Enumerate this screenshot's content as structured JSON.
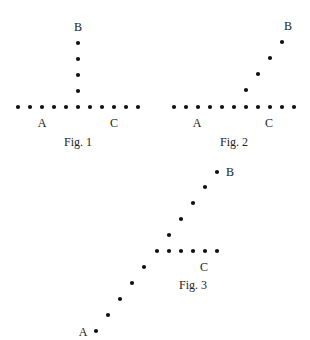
{
  "dot_color": "#111111",
  "dot_radius": 2.1,
  "figures": [
    {
      "id": "fig1",
      "caption": "Fig. 1",
      "caption_pos": [
        78,
        146
      ],
      "labels": [
        {
          "text": "B",
          "x": 78,
          "y": 31
        },
        {
          "text": "A",
          "x": 42,
          "y": 127
        },
        {
          "text": "C",
          "x": 114,
          "y": 127
        }
      ],
      "dots": [
        [
          18,
          107
        ],
        [
          30,
          107
        ],
        [
          42,
          107
        ],
        [
          54,
          107
        ],
        [
          66,
          107
        ],
        [
          78,
          107
        ],
        [
          90,
          107
        ],
        [
          102,
          107
        ],
        [
          114,
          107
        ],
        [
          126,
          107
        ],
        [
          138,
          107
        ],
        [
          78,
          91
        ],
        [
          78,
          75
        ],
        [
          78,
          59
        ],
        [
          78,
          43
        ]
      ]
    },
    {
      "id": "fig2",
      "caption": "Fig. 2",
      "caption_pos": [
        234,
        146
      ],
      "labels": [
        {
          "text": "B",
          "x": 288,
          "y": 30
        },
        {
          "text": "A",
          "x": 197,
          "y": 127
        },
        {
          "text": "C",
          "x": 269,
          "y": 127
        }
      ],
      "dots": [
        [
          174,
          107
        ],
        [
          186,
          107
        ],
        [
          198,
          107
        ],
        [
          210,
          107
        ],
        [
          222,
          107
        ],
        [
          234,
          107
        ],
        [
          246,
          107
        ],
        [
          258,
          107
        ],
        [
          270,
          107
        ],
        [
          282,
          107
        ],
        [
          294,
          107
        ],
        [
          246,
          90
        ],
        [
          258,
          74
        ],
        [
          270,
          58
        ],
        [
          282,
          42
        ]
      ]
    },
    {
      "id": "fig3",
      "caption": "Fig. 3",
      "caption_pos": [
        193,
        289
      ],
      "labels": [
        {
          "text": "B",
          "x": 230,
          "y": 176
        },
        {
          "text": "A",
          "x": 83,
          "y": 336
        },
        {
          "text": "C",
          "x": 204,
          "y": 271
        }
      ],
      "dots": [
        [
          96,
          331
        ],
        [
          108,
          315
        ],
        [
          120,
          299
        ],
        [
          132,
          283
        ],
        [
          144,
          267
        ],
        [
          157,
          251
        ],
        [
          169,
          251
        ],
        [
          181,
          251
        ],
        [
          193,
          251
        ],
        [
          205,
          251
        ],
        [
          217,
          251
        ],
        [
          169,
          235
        ],
        [
          181,
          219
        ],
        [
          193,
          203
        ],
        [
          205,
          187
        ],
        [
          217,
          172
        ]
      ]
    }
  ]
}
